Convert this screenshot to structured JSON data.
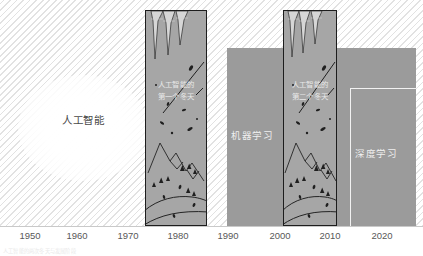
{
  "figure": {
    "type": "timeline-diagram",
    "title_visible": false,
    "background": "#ffffff",
    "hatch_color": "#e2e2e2"
  },
  "ai_region": {
    "label": "人工智能",
    "shape": "glow-circle",
    "color": "#4a4a4a"
  },
  "ml_region": {
    "label": "机器学习",
    "color": "#9b9b9b",
    "label_color": "#efefef",
    "start_year": 1988,
    "end_year": 2024
  },
  "dl_region": {
    "label": "深度学习",
    "color": "#9b9b9b",
    "label_color": "#efefef",
    "border_color": "#f2f2f2",
    "start_year": 2012,
    "end_year": 2024
  },
  "winters": [
    {
      "id": "winter-1",
      "line1": "人工智能的",
      "line2": "第一个冬天",
      "start_year": 1974,
      "end_year": 1984,
      "fill": "#a6a6a6",
      "border": "#1d1d1d"
    },
    {
      "id": "winter-2",
      "line1": "人工智能的",
      "line2": "第二个冬天",
      "start_year": 1999,
      "end_year": 2008,
      "fill": "#a6a6a6",
      "border": "#1d1d1d"
    }
  ],
  "axis": {
    "ticks": [
      {
        "label": "1950",
        "x": 30
      },
      {
        "label": "1960",
        "x": 77
      },
      {
        "label": "1970",
        "x": 128
      },
      {
        "label": "1980",
        "x": 178
      },
      {
        "label": "1990",
        "x": 228
      },
      {
        "label": "2000",
        "x": 280
      },
      {
        "label": "2010",
        "x": 330
      },
      {
        "label": "2020",
        "x": 382
      }
    ],
    "line_color": "#c9c9c9",
    "label_color": "#585858"
  },
  "footnote": {
    "text": "人工智能的两次冬天与发展阶段"
  },
  "chart_data": {
    "type": "timeline",
    "title": "",
    "xlabel": "",
    "ylabel": "",
    "xlim": [
      1945,
      2025
    ],
    "grid": false,
    "legend": "none",
    "categories": [
      "1950",
      "1960",
      "1970",
      "1980",
      "1990",
      "2000",
      "2010",
      "2020"
    ],
    "series": [
      {
        "name": "人工智能",
        "start": 1945,
        "end": 2025,
        "kind": "background"
      },
      {
        "name": "机器学习",
        "start": 1988,
        "end": 2024,
        "kind": "block"
      },
      {
        "name": "深度学习",
        "start": 2012,
        "end": 2024,
        "kind": "block"
      },
      {
        "name": "人工智能的第一个冬天",
        "start": 1974,
        "end": 1984,
        "kind": "winter"
      },
      {
        "name": "人工智能的第二个冬天",
        "start": 1999,
        "end": 2008,
        "kind": "winter"
      }
    ]
  }
}
